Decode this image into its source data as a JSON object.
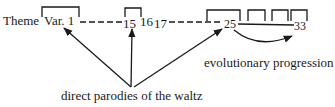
{
  "diagram": {
    "sequence": {
      "theme": "Theme",
      "var1": "Var. 1",
      "v15": "15",
      "v16": "16",
      "v17": "17",
      "v25": "25",
      "v33": "33"
    },
    "labels": {
      "evolutionary": "evolutionary progression",
      "parodies": "direct parodies of the waltz"
    },
    "colors": {
      "ink": "#1a1a1a",
      "background": "#ffffff"
    }
  }
}
